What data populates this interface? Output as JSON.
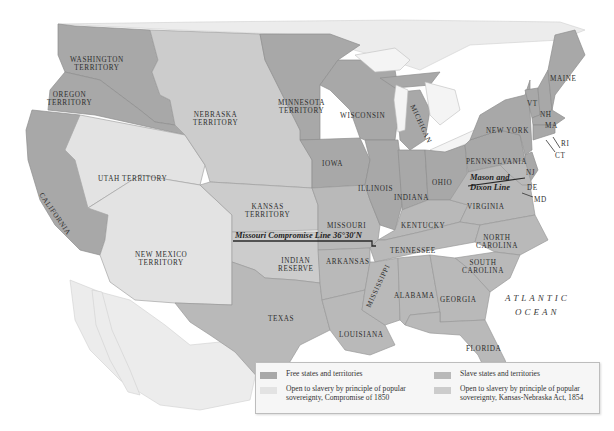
{
  "legend": {
    "items": [
      {
        "key": "free",
        "label": "Free states and territories",
        "color": "#a8a8a8"
      },
      {
        "key": "slave",
        "label": "Slave states and territories",
        "color": "#b9b9b9"
      },
      {
        "key": "c1850",
        "label": "Open to slavery by principle of popular sovereignty, Compromise of 1850",
        "color": "#e3e3e3"
      },
      {
        "key": "kn1854",
        "label": "Open to slavery by principle of popular sovereignty, Kansas-Nebraska Act, 1854",
        "color": "#cccccc"
      }
    ]
  },
  "lines": {
    "missouri": "Missouri Compromise Line 36°30′N",
    "mason_dixon_1": "Mason and",
    "mason_dixon_2": "Dixon Line"
  },
  "ocean": {
    "line1": "ATLANTIC",
    "line2": "OCEAN"
  },
  "regions": {
    "washington": [
      "Washington",
      "Territory"
    ],
    "oregon": [
      "Oregon",
      "Territory"
    ],
    "california": "California",
    "utah": "Utah Territory",
    "new_mexico": [
      "New Mexico",
      "Territory"
    ],
    "nebraska": [
      "Nebraska",
      "Territory"
    ],
    "kansas": [
      "Kansas",
      "Territory"
    ],
    "minnesota": [
      "Minnesota",
      "Territory"
    ],
    "indian_reserve": [
      "Indian",
      "Reserve"
    ],
    "texas": "Texas",
    "iowa": "Iowa",
    "missouri": "Missouri",
    "arkansas": "Arkansas",
    "louisiana": "Louisiana",
    "wisconsin": "Wisconsin",
    "michigan": "Michigan",
    "illinois": "Illinois",
    "indiana": "Indiana",
    "ohio": "Ohio",
    "kentucky": "Kentucky",
    "tennessee": "Tennessee",
    "mississippi": "Mississippi",
    "alabama": "Alabama",
    "georgia": "Georgia",
    "florida": "Florida",
    "south_carolina": [
      "South",
      "Carolina"
    ],
    "north_carolina": [
      "North",
      "Carolina"
    ],
    "virginia": "Virginia",
    "pennsylvania": "Pennsylvania",
    "new_york": "New York",
    "vermont": "VT",
    "new_hampshire": "NH",
    "massachusetts": "MA",
    "rhode_island": "RI",
    "connecticut": "CT",
    "new_jersey": "NJ",
    "delaware": "DE",
    "maryland": "MD",
    "maine": "Maine"
  }
}
